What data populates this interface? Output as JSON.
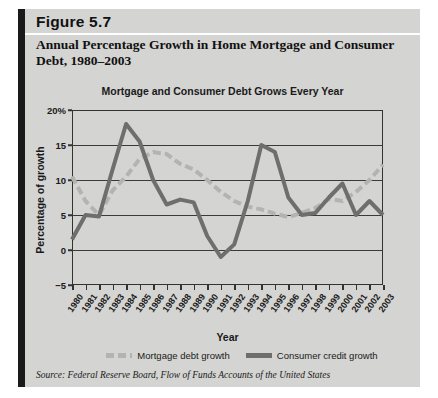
{
  "figure": {
    "number": "Figure 5.7",
    "title": "Annual Percentage Growth in Home Mortgage and Consumer Debt, 1980–2003",
    "source": "Source: Federal Reserve Board, Flow of Funds Accounts of the United States"
  },
  "colors": {
    "card_background": "#d4d4d2",
    "left_rule": "#1a1a1a",
    "mortgage_series": "#b3b3b1",
    "consumer_series": "#6e6e6e",
    "axis": "#333333",
    "text": "#1a1a1a"
  },
  "legend": {
    "position": "bottom-center",
    "items": [
      {
        "label": "Mortgage debt growth",
        "style": "dashed",
        "color": "#b3b3b1"
      },
      {
        "label": "Consumer credit growth",
        "style": "solid",
        "color": "#6e6e6e"
      }
    ]
  },
  "chart_data": {
    "type": "line",
    "title": "Mortgage and Consumer Debt Grows Every Year",
    "xlabel": "Year",
    "ylabel": "Percentage of growth",
    "grid": true,
    "ylim": [
      -5,
      20
    ],
    "yticks": [
      -5,
      0,
      5,
      10,
      15,
      20
    ],
    "ytick_labels": [
      "−5",
      "0",
      "5",
      "10",
      "15",
      "20%"
    ],
    "categories": [
      "1980",
      "1981",
      "1982",
      "1983",
      "1984",
      "1985",
      "1986",
      "1987",
      "1988",
      "1989",
      "1990",
      "1991",
      "1992",
      "1993",
      "1994",
      "1995",
      "1996",
      "1997",
      "1998",
      "1999",
      "2000",
      "2001",
      "2002",
      "2003"
    ],
    "series": [
      {
        "name": "Mortgage debt growth",
        "color": "#b3b3b1",
        "style": "dashed",
        "values": [
          10.5,
          7.0,
          5.0,
          8.5,
          10.5,
          13.0,
          14.0,
          13.7,
          12.3,
          11.5,
          10.0,
          8.3,
          7.0,
          6.2,
          5.8,
          5.2,
          4.7,
          5.3,
          6.0,
          7.3,
          7.0,
          8.3,
          10.0,
          12.2
        ]
      },
      {
        "name": "Consumer credit growth",
        "color": "#6e6e6e",
        "style": "solid",
        "values": [
          1.5,
          5.0,
          4.8,
          11.5,
          18.0,
          15.5,
          10.0,
          6.5,
          7.2,
          6.8,
          2.0,
          -1.0,
          0.8,
          7.0,
          15.0,
          14.0,
          7.5,
          5.0,
          5.3,
          7.5,
          9.5,
          5.0,
          7.0,
          5.0
        ]
      }
    ]
  }
}
